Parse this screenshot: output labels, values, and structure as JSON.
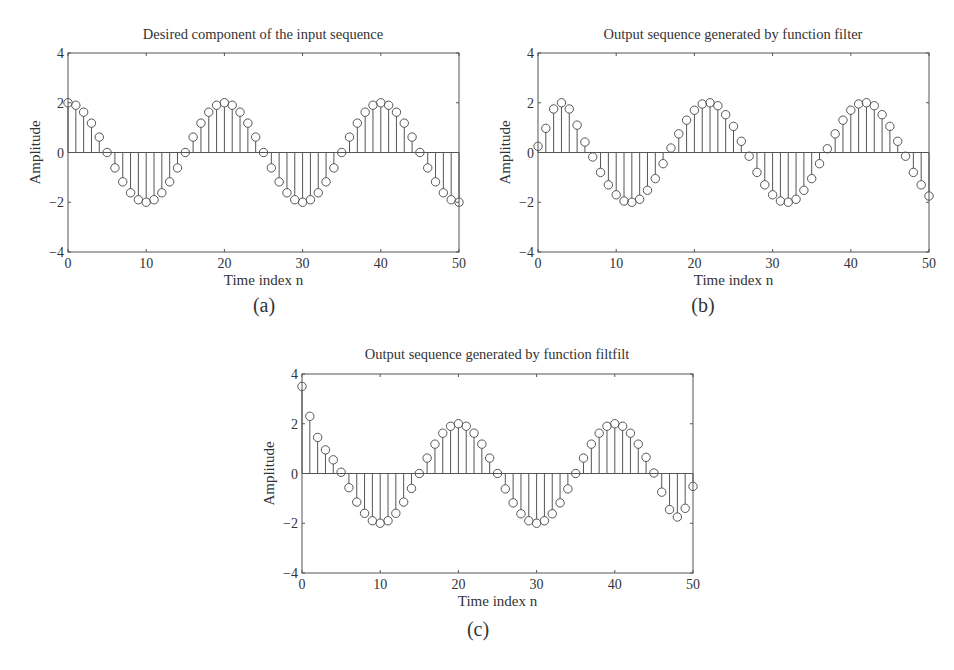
{
  "chart_data": [
    {
      "type": "stem",
      "panel": "(a)",
      "title": "Desired component of the input sequence",
      "xlabel": "Time index n",
      "ylabel": "Amplitude",
      "xlim": [
        0,
        50
      ],
      "ylim": [
        -4,
        4
      ],
      "xticks": [
        0,
        10,
        20,
        30,
        40,
        50
      ],
      "yticks": [
        -4,
        -2,
        0,
        2,
        4
      ],
      "grid": false,
      "x": [
        0,
        1,
        2,
        3,
        4,
        5,
        6,
        7,
        8,
        9,
        10,
        11,
        12,
        13,
        14,
        15,
        16,
        17,
        18,
        19,
        20,
        21,
        22,
        23,
        24,
        25,
        26,
        27,
        28,
        29,
        30,
        31,
        32,
        33,
        34,
        35,
        36,
        37,
        38,
        39,
        40,
        41,
        42,
        43,
        44,
        45,
        46,
        47,
        48,
        49,
        50
      ],
      "values": [
        2.0,
        1.9,
        1.62,
        1.18,
        0.62,
        0.0,
        -0.62,
        -1.18,
        -1.62,
        -1.9,
        -2.0,
        -1.9,
        -1.62,
        -1.18,
        -0.62,
        0.0,
        0.62,
        1.18,
        1.62,
        1.9,
        2.0,
        1.9,
        1.62,
        1.18,
        0.62,
        0.0,
        -0.62,
        -1.18,
        -1.62,
        -1.9,
        -2.0,
        -1.9,
        -1.62,
        -1.18,
        -0.62,
        0.0,
        0.62,
        1.18,
        1.62,
        1.9,
        2.0,
        1.9,
        1.62,
        1.18,
        0.62,
        0.0,
        -0.62,
        -1.18,
        -1.62,
        -1.9,
        -2.0
      ]
    },
    {
      "type": "stem",
      "panel": "(b)",
      "title": "Output sequence generated by function filter",
      "xlabel": "Time index n",
      "ylabel": "Amplitude",
      "xlim": [
        0,
        50
      ],
      "ylim": [
        -4,
        4
      ],
      "xticks": [
        0,
        10,
        20,
        30,
        40,
        50
      ],
      "yticks": [
        -4,
        -2,
        0,
        2,
        4
      ],
      "grid": false,
      "x": [
        0,
        1,
        2,
        3,
        4,
        5,
        6,
        7,
        8,
        9,
        10,
        11,
        12,
        13,
        14,
        15,
        16,
        17,
        18,
        19,
        20,
        21,
        22,
        23,
        24,
        25,
        26,
        27,
        28,
        29,
        30,
        31,
        32,
        33,
        34,
        35,
        36,
        37,
        38,
        39,
        40,
        41,
        42,
        43,
        44,
        45,
        46,
        47,
        48,
        49,
        50
      ],
      "values": [
        0.25,
        0.97,
        1.75,
        2.0,
        1.75,
        1.1,
        0.42,
        -0.18,
        -0.8,
        -1.3,
        -1.7,
        -1.95,
        -2.0,
        -1.88,
        -1.52,
        -1.05,
        -0.45,
        0.18,
        0.75,
        1.3,
        1.7,
        1.95,
        2.0,
        1.88,
        1.52,
        1.05,
        0.45,
        -0.15,
        -0.8,
        -1.3,
        -1.7,
        -1.95,
        -2.0,
        -1.88,
        -1.52,
        -1.05,
        -0.45,
        0.15,
        0.75,
        1.3,
        1.7,
        1.95,
        2.0,
        1.88,
        1.52,
        1.05,
        0.45,
        -0.15,
        -0.8,
        -1.3,
        -1.75
      ]
    },
    {
      "type": "stem",
      "panel": "(c)",
      "title": "Output sequence generated by function filtfilt",
      "xlabel": "Time index n",
      "ylabel": "Amplitude",
      "xlim": [
        0,
        50
      ],
      "ylim": [
        -4,
        4
      ],
      "xticks": [
        0,
        10,
        20,
        30,
        40,
        50
      ],
      "yticks": [
        -4,
        -2,
        0,
        2,
        4
      ],
      "grid": false,
      "x": [
        0,
        1,
        2,
        3,
        4,
        5,
        6,
        7,
        8,
        9,
        10,
        11,
        12,
        13,
        14,
        15,
        16,
        17,
        18,
        19,
        20,
        21,
        22,
        23,
        24,
        25,
        26,
        27,
        28,
        29,
        30,
        31,
        32,
        33,
        34,
        35,
        36,
        37,
        38,
        39,
        40,
        41,
        42,
        43,
        44,
        45,
        46,
        47,
        48,
        49,
        50
      ],
      "values": [
        3.5,
        2.3,
        1.45,
        0.95,
        0.55,
        0.05,
        -0.57,
        -1.15,
        -1.6,
        -1.9,
        -2.0,
        -1.9,
        -1.6,
        -1.15,
        -0.6,
        0.0,
        0.62,
        1.18,
        1.62,
        1.9,
        2.0,
        1.9,
        1.62,
        1.18,
        0.62,
        0.0,
        -0.62,
        -1.18,
        -1.62,
        -1.9,
        -2.0,
        -1.9,
        -1.62,
        -1.18,
        -0.62,
        0.0,
        0.62,
        1.18,
        1.62,
        1.9,
        2.0,
        1.9,
        1.62,
        1.18,
        0.65,
        0.02,
        -0.75,
        -1.45,
        -1.75,
        -1.4,
        -0.52
      ]
    }
  ],
  "panels": [
    {
      "title": "Desired component of the input sequence",
      "caption": "(a)",
      "xlabel": "Time index n",
      "ylabel": "Amplitude"
    },
    {
      "title": "Output sequence generated by function filter",
      "caption": "(b)",
      "xlabel": "Time index n",
      "ylabel": "Amplitude"
    },
    {
      "title": "Output sequence generated by function filtfilt",
      "caption": "(c)",
      "xlabel": "Time index n",
      "ylabel": "Amplitude"
    }
  ],
  "colors": {
    "axis": "#555555",
    "stem": "#555555",
    "text": "#333333",
    "background": "#ffffff"
  }
}
